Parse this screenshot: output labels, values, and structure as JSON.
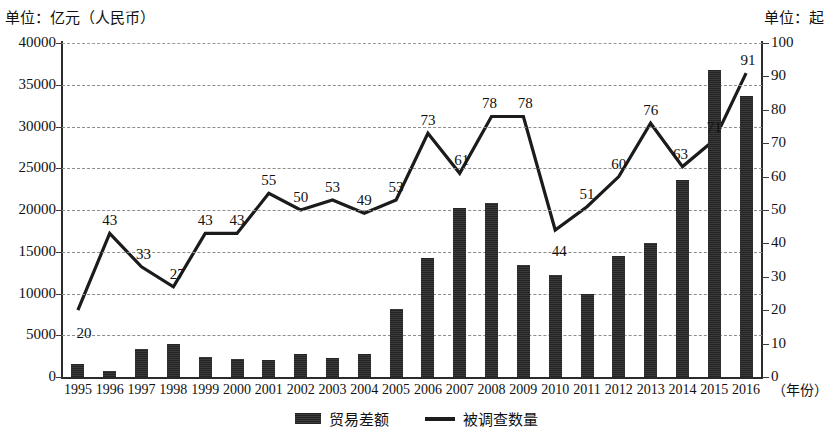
{
  "units": {
    "left": "单位：亿元（人民币）",
    "right": "单位：起"
  },
  "axes": {
    "x_title": "（年份）",
    "left_ticks": [
      "0",
      "5000",
      "10000",
      "15000",
      "20000",
      "25000",
      "30000",
      "35000",
      "40000"
    ],
    "right_ticks": [
      "0",
      "10",
      "20",
      "30",
      "40",
      "50",
      "60",
      "70",
      "80",
      "90",
      "100"
    ]
  },
  "legend": {
    "bar_label": "贸易差额",
    "line_label": "被调查数量"
  },
  "chart_data": {
    "type": "bar",
    "title": "",
    "subtitle": "",
    "xlabel": "（年份）",
    "ylabel": "单位：亿元（人民币）",
    "y2label": "单位：起",
    "ylim": [
      0,
      40000
    ],
    "y2lim": [
      0,
      100
    ],
    "grid": true,
    "legend_position": "bottom-center",
    "categories": [
      "1995",
      "1996",
      "1997",
      "1998",
      "1999",
      "2000",
      "2001",
      "2002",
      "2003",
      "2004",
      "2005",
      "2006",
      "2007",
      "2008",
      "2009",
      "2010",
      "2011",
      "2012",
      "2013",
      "2014",
      "2015",
      "2016"
    ],
    "series": [
      {
        "name": "贸易差额",
        "type": "bar",
        "axis": "left",
        "unit": "亿元（人民币）",
        "values": [
          1500,
          700,
          3400,
          3900,
          2400,
          2100,
          2000,
          2700,
          2300,
          2800,
          8200,
          14200,
          20300,
          20900,
          13400,
          12200,
          10000,
          14500,
          16100,
          23600,
          36800,
          33600
        ],
        "labels": [
          "",
          "",
          "",
          "",
          "",
          "",
          "",
          "",
          "",
          "",
          "",
          "",
          "",
          "",
          "",
          "",
          "",
          "",
          "",
          "",
          "",
          ""
        ]
      },
      {
        "name": "被调查数量",
        "type": "line",
        "axis": "right",
        "unit": "起",
        "values": [
          20,
          43,
          33,
          27,
          43,
          43,
          55,
          50,
          53,
          49,
          53,
          73,
          61,
          78,
          78,
          44,
          51,
          60,
          76,
          63,
          71,
          91
        ],
        "labels": [
          "20",
          "43",
          "33",
          "27",
          "43",
          "43",
          "55",
          "50",
          "53",
          "49",
          "53",
          "73",
          "61",
          "78",
          "78",
          "44",
          "51",
          "60",
          "76",
          "63",
          "71",
          "91"
        ]
      }
    ]
  }
}
